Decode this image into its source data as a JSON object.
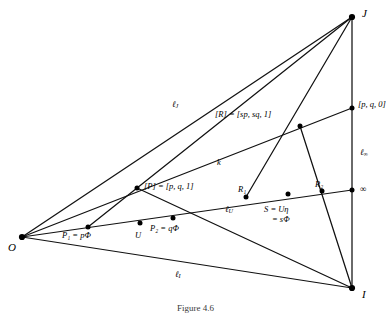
{
  "figure": {
    "caption": "Figure 4.6",
    "vertices": [
      {
        "id": "O",
        "label": "O",
        "x": 22,
        "y": 237,
        "lx": 8,
        "ly": 242
      },
      {
        "id": "J",
        "label": "J",
        "x": 352,
        "y": 17,
        "lx": 362,
        "ly": 8
      },
      {
        "id": "I",
        "label": "I",
        "x": 352,
        "y": 288,
        "lx": 362,
        "ly": 289
      }
    ],
    "points": [
      {
        "id": "P",
        "x": 137,
        "y": 188
      },
      {
        "id": "R",
        "x": 300,
        "y": 126
      },
      {
        "id": "pq0",
        "x": 352,
        "y": 108
      },
      {
        "id": "P1",
        "x": 88,
        "y": 227
      },
      {
        "id": "U",
        "x": 140,
        "y": 223
      },
      {
        "id": "P2",
        "x": 173,
        "y": 218
      },
      {
        "id": "R1",
        "x": 246,
        "y": 197
      },
      {
        "id": "S",
        "x": 288,
        "y": 194
      },
      {
        "id": "R2",
        "x": 322,
        "y": 191
      },
      {
        "id": "inf",
        "x": 352,
        "y": 190
      }
    ],
    "segments": [
      {
        "name": "O-J",
        "x1": 22,
        "y1": 237,
        "x2": 352,
        "y2": 17
      },
      {
        "name": "O-I",
        "x1": 22,
        "y1": 237,
        "x2": 352,
        "y2": 288
      },
      {
        "name": "O-infinity",
        "x1": 22,
        "y1": 237,
        "x2": 352,
        "y2": 190
      },
      {
        "name": "O-pq0",
        "x1": 22,
        "y1": 237,
        "x2": 352,
        "y2": 108
      },
      {
        "name": "J-I",
        "x1": 352,
        "y1": 17,
        "x2": 352,
        "y2": 288
      },
      {
        "name": "J-P1",
        "x1": 352,
        "y1": 17,
        "x2": 88,
        "y2": 227
      },
      {
        "name": "J-R1",
        "x1": 352,
        "y1": 17,
        "x2": 246,
        "y2": 197
      },
      {
        "name": "I-P",
        "x1": 352,
        "y1": 288,
        "x2": 137,
        "y2": 188
      },
      {
        "name": "I-R",
        "x1": 352,
        "y1": 288,
        "x2": 300,
        "y2": 126
      }
    ],
    "labels": {
      "point_P": {
        "text": "[P] = [p, q, 1]",
        "x": 144,
        "y": 182
      },
      "point_R": {
        "text": "[R] = [sp, sq, 1]",
        "x": 215,
        "y": 110
      },
      "point_pq0": {
        "text": "[p, q, 0]",
        "x": 358,
        "y": 100
      },
      "point_P1": {
        "text": "P₁ = pΦ",
        "x": 62,
        "y": 231
      },
      "point_U": {
        "text": "U",
        "x": 135,
        "y": 231
      },
      "point_P2": {
        "text": "P₂ = qΦ",
        "x": 150,
        "y": 224
      },
      "point_R1": {
        "text": "R₁",
        "x": 238,
        "y": 185
      },
      "point_R2": {
        "text": "R₂",
        "x": 315,
        "y": 180
      },
      "point_S_1": {
        "text": "S = Uη",
        "x": 264,
        "y": 205
      },
      "point_S_2": {
        "text": "= sΦ",
        "x": 272,
        "y": 215
      },
      "point_inf": {
        "text": "∞",
        "x": 360,
        "y": 185
      },
      "line_J": {
        "text": "ℓ",
        "sub": "J",
        "x": 172,
        "y": 100
      },
      "line_k": {
        "text": "k",
        "sub": "",
        "x": 217,
        "y": 158
      },
      "line_U": {
        "text": "ℓ",
        "sub": "U",
        "x": 225,
        "y": 205
      },
      "line_I": {
        "text": "ℓ",
        "sub": "I",
        "x": 175,
        "y": 270
      },
      "line_inf": {
        "text": "ℓ",
        "sub": "∞",
        "x": 360,
        "y": 148
      }
    },
    "style": {
      "stroke": "#111111",
      "dot": "#000000",
      "background": "#ffffff"
    }
  }
}
